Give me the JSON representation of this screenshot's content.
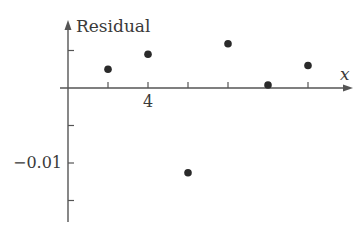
{
  "chart_data": {
    "type": "scatter",
    "title": "",
    "xlabel": "x",
    "ylabel": "Residual",
    "x_tick_labels": [
      {
        "x": 4,
        "label": "4"
      }
    ],
    "y_tick_labels": [
      {
        "y": -0.01,
        "label": "−0.01"
      }
    ],
    "x_ticks": [
      3,
      4,
      5,
      6,
      7,
      8
    ],
    "y_ticks": [
      0.005,
      0,
      -0.005,
      -0.01,
      -0.015
    ],
    "xlim": [
      2.0,
      9.1
    ],
    "ylim": [
      -0.018,
      0.0088
    ],
    "grid": false,
    "legend": null,
    "points": [
      {
        "x": 3,
        "y": 0.0025
      },
      {
        "x": 4,
        "y": 0.0045
      },
      {
        "x": 5,
        "y": -0.0113
      },
      {
        "x": 6,
        "y": 0.0059
      },
      {
        "x": 7,
        "y": 0.0004
      },
      {
        "x": 8,
        "y": 0.003
      }
    ],
    "colors": {
      "axis": "#555555",
      "point": "#2a2a2a",
      "text": "#3a3a3a"
    }
  }
}
